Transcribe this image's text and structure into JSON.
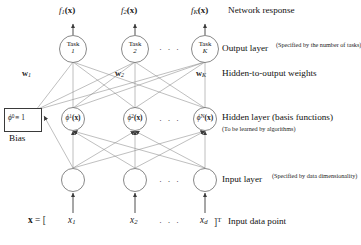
{
  "diagram": {
    "colors": {
      "stroke": "#5a5a5a",
      "node_stroke": "#6a6a6a",
      "text": "#111111",
      "bg": "#ffffff"
    },
    "response": {
      "outputs": [
        {
          "label_f": "f",
          "sub": "1",
          "arg": "(x)"
        },
        {
          "label_f": "f",
          "sub": "2",
          "arg": "(x)"
        },
        {
          "label_f": "f",
          "sub": "K",
          "arg": "(x)"
        }
      ],
      "caption": "Network response"
    },
    "output_layer": {
      "caption": "Output layer",
      "note": "(Specified by the number of tasks)",
      "nodes": [
        {
          "line1": "Task",
          "line2": "1"
        },
        {
          "line1": "Task",
          "line2": "2"
        },
        {
          "line1": "Task",
          "line2": "K"
        }
      ],
      "ellipsis": "· · ·"
    },
    "weights": {
      "caption": "Hidden-to-output weights",
      "labels": [
        {
          "sym": "w",
          "sub": "1"
        },
        {
          "sym": "w",
          "sub": "2"
        },
        {
          "sym": "w",
          "sub": "K"
        }
      ]
    },
    "hidden_layer": {
      "caption": "Hidden layer (basis functions)",
      "note": "(To be learned by algorithms)",
      "nodes": [
        {
          "sym": "ϕ",
          "sup": "1",
          "arg": "(x)"
        },
        {
          "sym": "ϕ",
          "sup": "2",
          "arg": "(x)"
        },
        {
          "sym": "ϕ",
          "sup": "N",
          "arg": "(x)"
        }
      ],
      "ellipsis": "· · ·"
    },
    "bias": {
      "box_sym": "ϕ",
      "box_sup": "0",
      "box_rel": "≡ 1",
      "label": "Bias"
    },
    "input_layer": {
      "caption": "Input layer",
      "note": "(Specified by data dimensionality)",
      "ellipsis": "· · ·",
      "node_count": 3
    },
    "input_vector": {
      "lhs": "x",
      "equals": "=",
      "open_bracket": "[",
      "components": [
        {
          "sym": "x",
          "sub": "1"
        },
        {
          "sym": "x",
          "sub": "2"
        },
        {
          "sym": "x",
          "sub": "d"
        }
      ],
      "ellipsis": "· · ·",
      "close_bracket": "]",
      "transpose": "T",
      "caption": "Input data point"
    }
  }
}
